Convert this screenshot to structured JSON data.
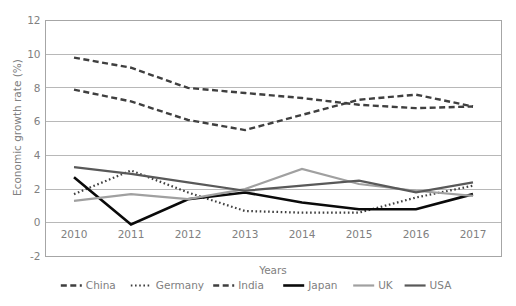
{
  "chart_data": {
    "type": "line",
    "title": "",
    "xlabel": "Years",
    "ylabel": "Economic growth rate (%)",
    "categories": [
      "2010",
      "2011",
      "2012",
      "2013",
      "2014",
      "2015",
      "2016",
      "2017"
    ],
    "x": [
      2010,
      2011,
      2012,
      2013,
      2014,
      2015,
      2016,
      2017
    ],
    "ylim": [
      -2,
      12
    ],
    "yticks": [
      -2,
      0,
      2,
      4,
      6,
      8,
      10,
      12
    ],
    "ytick_labels": [
      "-2",
      "0",
      "2",
      "4",
      "6",
      "8",
      "10",
      "12"
    ],
    "grid": "horizontal",
    "legend_position": "bottom",
    "series": [
      {
        "name": "China",
        "values": [
          9.8,
          9.2,
          8.0,
          7.7,
          7.4,
          7.0,
          6.8,
          6.9
        ],
        "color": "#3f3f3f",
        "style": "dashed",
        "width": 2.4,
        "dasharray": "6,3.5"
      },
      {
        "name": "Germany",
        "values": [
          1.7,
          3.1,
          1.8,
          0.7,
          0.6,
          0.6,
          1.5,
          2.2
        ],
        "color": "#3f3f3f",
        "style": "dotted",
        "width": 2.2,
        "dasharray": "1.6,2.6"
      },
      {
        "name": "India",
        "values": [
          7.9,
          7.2,
          6.1,
          5.5,
          6.4,
          7.3,
          7.6,
          6.9
        ],
        "color": "#3f3f3f",
        "style": "dashed",
        "width": 2.4,
        "dasharray": "6,3.5"
      },
      {
        "name": "Japan",
        "values": [
          2.7,
          -0.1,
          1.4,
          1.8,
          1.2,
          0.8,
          0.8,
          1.7
        ],
        "color": "#0a0a0a",
        "style": "solid",
        "width": 2.6,
        "dasharray": ""
      },
      {
        "name": "UK",
        "values": [
          1.3,
          1.7,
          1.4,
          2.0,
          3.2,
          2.3,
          1.9,
          1.6
        ],
        "color": "#a0a0a0",
        "style": "solid",
        "width": 2.2,
        "dasharray": ""
      },
      {
        "name": "USA",
        "values": [
          3.3,
          2.9,
          2.4,
          1.9,
          2.2,
          2.5,
          1.8,
          2.4
        ],
        "color": "#595959",
        "style": "solid",
        "width": 2.2,
        "dasharray": ""
      }
    ]
  },
  "legend": {
    "items": [
      "China",
      "Germany",
      "India",
      "Japan",
      "UK",
      "USA"
    ]
  },
  "axes": {
    "y_title": "Economic growth rate (%)",
    "x_title": "Years"
  }
}
